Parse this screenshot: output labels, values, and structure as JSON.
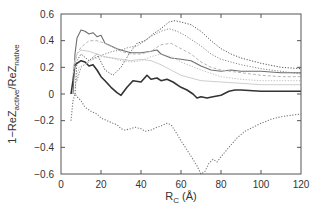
{
  "chart_data": {
    "type": "line",
    "title": "",
    "xlabel": "R_C (Å)",
    "xlabel_main": "R",
    "xlabel_sub": "C",
    "xlabel_unit": " (Å)",
    "ylabel_parts": {
      "prefix": "1−ReZ",
      "sub1": "active",
      "mid": "/ReZ",
      "sub2": "native"
    },
    "xlim": [
      0,
      120
    ],
    "ylim": [
      -0.6,
      0.6
    ],
    "xticks": [
      0,
      20,
      40,
      60,
      80,
      100,
      120
    ],
    "xtick_labels": [
      "0",
      "20",
      "40",
      "60",
      "80",
      "100",
      "120"
    ],
    "yticks": [
      -0.6,
      -0.4,
      -0.2,
      0,
      0.2,
      0.4,
      0.6
    ],
    "ytick_labels": [
      "−0.6",
      "−0.4",
      "−0.2",
      "0",
      "0.2",
      "0.4",
      "0.6"
    ],
    "grid": false,
    "legend": "none",
    "series": [
      {
        "name": "series-dark-solid",
        "style": "solid",
        "color": "#333333",
        "width": 1.6,
        "x": [
          5,
          6,
          7,
          8,
          10,
          12,
          14,
          16,
          18,
          20,
          22,
          25,
          28,
          30,
          33,
          36,
          40,
          43,
          45,
          48,
          50,
          53,
          56,
          60,
          63,
          66,
          68,
          70,
          73,
          76,
          80,
          84,
          87,
          90,
          100,
          110,
          120
        ],
        "y": [
          0.0,
          0.1,
          0.22,
          0.23,
          0.25,
          0.24,
          0.21,
          0.22,
          0.18,
          0.13,
          0.1,
          0.05,
          0.01,
          -0.01,
          0.05,
          0.1,
          0.09,
          0.14,
          0.11,
          0.12,
          0.1,
          0.11,
          0.09,
          0.05,
          0.03,
          0.0,
          -0.03,
          -0.02,
          -0.03,
          -0.02,
          -0.01,
          0.02,
          0.03,
          0.03,
          0.02,
          0.02,
          0.02
        ]
      },
      {
        "name": "series-gray-solid",
        "style": "solid",
        "color": "#6e6e6e",
        "width": 1.1,
        "x": [
          6,
          7,
          8,
          10,
          12,
          14,
          16,
          18,
          20,
          22,
          25,
          28,
          30,
          35,
          40,
          45,
          48,
          50,
          55,
          60,
          65,
          70,
          75,
          80,
          85,
          90,
          100,
          110,
          120
        ],
        "y": [
          0.0,
          0.3,
          0.42,
          0.48,
          0.47,
          0.45,
          0.46,
          0.43,
          0.44,
          0.38,
          0.36,
          0.34,
          0.33,
          0.31,
          0.31,
          0.32,
          0.33,
          0.3,
          0.27,
          0.26,
          0.25,
          0.21,
          0.18,
          0.17,
          0.18,
          0.17,
          0.17,
          0.16,
          0.16
        ]
      },
      {
        "name": "series-dark-dotted-upper",
        "style": "dotted",
        "color": "#555555",
        "width": 1.0,
        "x": [
          7,
          8,
          10,
          14,
          18,
          22,
          26,
          30,
          34,
          38,
          42,
          46,
          50,
          54,
          57,
          60,
          65,
          70,
          75,
          80,
          85,
          90,
          100,
          110,
          120
        ],
        "y": [
          0.0,
          0.25,
          0.3,
          0.25,
          0.3,
          0.18,
          0.14,
          0.2,
          0.3,
          0.38,
          0.4,
          0.45,
          0.49,
          0.54,
          0.55,
          0.54,
          0.52,
          0.47,
          0.4,
          0.34,
          0.3,
          0.27,
          0.23,
          0.2,
          0.19
        ]
      },
      {
        "name": "series-dotted-mid-upper",
        "style": "dotted",
        "color": "#888888",
        "width": 1.0,
        "x": [
          8,
          10,
          14,
          18,
          22,
          26,
          30,
          34,
          38,
          42,
          46,
          50,
          54,
          58,
          62,
          66,
          70,
          75,
          80,
          90,
          100,
          110,
          120
        ],
        "y": [
          0.1,
          0.2,
          0.25,
          0.28,
          0.3,
          0.32,
          0.33,
          0.35,
          0.36,
          0.4,
          0.44,
          0.47,
          0.49,
          0.47,
          0.44,
          0.4,
          0.36,
          0.3,
          0.26,
          0.22,
          0.19,
          0.17,
          0.15
        ]
      },
      {
        "name": "series-light-dashed",
        "style": "dashed",
        "color": "#b5b5b5",
        "width": 1.0,
        "x": [
          6,
          8,
          10,
          14,
          18,
          22,
          26,
          30,
          35,
          40,
          45,
          50,
          55,
          60,
          65,
          70,
          75,
          80,
          90,
          100,
          110,
          120
        ],
        "y": [
          0.15,
          0.3,
          0.35,
          0.4,
          0.4,
          0.38,
          0.35,
          0.32,
          0.3,
          0.3,
          0.32,
          0.37,
          0.38,
          0.34,
          0.3,
          0.24,
          0.2,
          0.18,
          0.16,
          0.14,
          0.13,
          0.13
        ]
      },
      {
        "name": "series-light-solid",
        "style": "solid",
        "color": "#cfcfcf",
        "width": 1.0,
        "x": [
          6,
          8,
          10,
          14,
          18,
          22,
          26,
          30,
          35,
          40,
          45,
          50,
          55,
          60,
          65,
          70,
          80,
          90,
          100,
          110,
          120
        ],
        "y": [
          0.2,
          0.3,
          0.33,
          0.32,
          0.3,
          0.28,
          0.27,
          0.26,
          0.25,
          0.26,
          0.25,
          0.22,
          0.18,
          0.14,
          0.12,
          0.1,
          0.09,
          0.08,
          0.07,
          0.07,
          0.07
        ]
      },
      {
        "name": "series-light-dotted",
        "style": "dotted",
        "color": "#bdbdbd",
        "width": 1.0,
        "x": [
          7,
          9,
          12,
          16,
          20,
          25,
          30,
          35,
          40,
          45,
          50,
          55,
          60,
          70,
          80,
          90,
          100,
          110,
          120
        ],
        "y": [
          0.05,
          0.2,
          0.22,
          0.26,
          0.28,
          0.27,
          0.25,
          0.24,
          0.25,
          0.28,
          0.3,
          0.28,
          0.24,
          0.18,
          0.13,
          0.11,
          0.1,
          0.1,
          0.1
        ]
      },
      {
        "name": "series-dotted-lower",
        "style": "dotted",
        "color": "#777777",
        "width": 1.1,
        "x": [
          5,
          6,
          7,
          8,
          10,
          12,
          15,
          18,
          20,
          23,
          26,
          28,
          30,
          32,
          35,
          37,
          40,
          42,
          45,
          48,
          50,
          53,
          55,
          58,
          60,
          63,
          66,
          68,
          70,
          72,
          74,
          76,
          78,
          80,
          84,
          88,
          92,
          96,
          100,
          105,
          110,
          115,
          120
        ],
        "y": [
          -0.2,
          -0.05,
          0.0,
          -0.02,
          -0.05,
          -0.1,
          -0.13,
          -0.15,
          -0.18,
          -0.2,
          -0.22,
          -0.23,
          -0.26,
          -0.27,
          -0.26,
          -0.25,
          -0.26,
          -0.28,
          -0.27,
          -0.25,
          -0.24,
          -0.22,
          -0.23,
          -0.3,
          -0.35,
          -0.42,
          -0.49,
          -0.54,
          -0.6,
          -0.58,
          -0.52,
          -0.49,
          -0.51,
          -0.47,
          -0.4,
          -0.33,
          -0.28,
          -0.25,
          -0.22,
          -0.19,
          -0.17,
          -0.16,
          -0.15
        ]
      }
    ]
  }
}
